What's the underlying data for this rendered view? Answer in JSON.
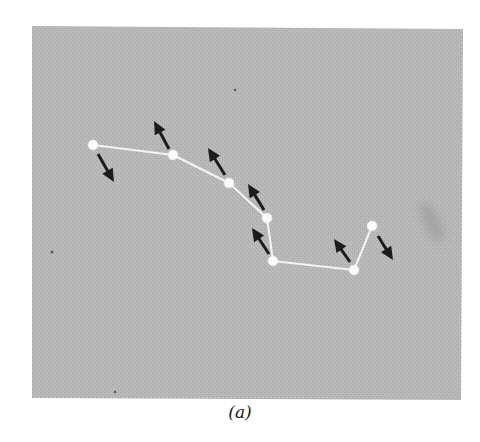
{
  "figure": {
    "caption": "(a)",
    "panel": {
      "x": 32,
      "y": 26,
      "width": 431,
      "height": 374,
      "color": "#b5b5b5",
      "texture_color": "#a9a9a9"
    },
    "polyline": {
      "color": "#f4f4f4",
      "stroke_width": 2,
      "node_radius": 5,
      "nodes": [
        {
          "x": 93,
          "y": 145
        },
        {
          "x": 173,
          "y": 155
        },
        {
          "x": 229,
          "y": 183
        },
        {
          "x": 267,
          "y": 218
        },
        {
          "x": 273,
          "y": 261
        },
        {
          "x": 354,
          "y": 270
        },
        {
          "x": 372,
          "y": 226
        }
      ]
    },
    "arrows": {
      "color": "#1c1c1c",
      "shaft_width": 3,
      "head_length": 13,
      "head_width": 12,
      "items": [
        {
          "from": [
            98,
            154
          ],
          "to": [
            114,
            182
          ]
        },
        {
          "from": [
            169,
            149
          ],
          "to": [
            154,
            121
          ]
        },
        {
          "from": [
            225,
            175
          ],
          "to": [
            208,
            148
          ]
        },
        {
          "from": [
            264,
            210
          ],
          "to": [
            248,
            184
          ]
        },
        {
          "from": [
            269,
            254
          ],
          "to": [
            252,
            228
          ]
        },
        {
          "from": [
            350,
            262
          ],
          "to": [
            334,
            239
          ]
        },
        {
          "from": [
            378,
            236
          ],
          "to": [
            393,
            260
          ]
        }
      ]
    },
    "artifacts": [
      {
        "x": 235,
        "y": 90,
        "r": 1.2
      },
      {
        "x": 52,
        "y": 252,
        "r": 1.5
      },
      {
        "x": 115,
        "y": 392,
        "r": 1.2
      }
    ],
    "smudge": {
      "x": 432,
      "y": 222,
      "rx": 8,
      "ry": 22,
      "color": "#8f8f8f"
    }
  }
}
